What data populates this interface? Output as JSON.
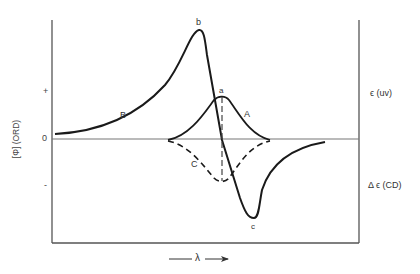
{
  "diagram": {
    "title": "",
    "y_axis_left_label": "[Φ] (ORD)",
    "y_axis_ticks": {
      "plus": "+",
      "zero": "0",
      "minus": "-"
    },
    "right_labels": {
      "uv": "ϵ (uv)",
      "cd": "Δ ϵ (CD)"
    },
    "x_axis_label": "λ",
    "curve_labels": {
      "ord_curve": "B",
      "uv_curve": "A",
      "cd_curve": "C",
      "peak": "b",
      "trough": "c",
      "center": "a"
    },
    "colors": {
      "line": "#1a1a1a",
      "frame": "#555555",
      "background": "#ffffff"
    }
  }
}
